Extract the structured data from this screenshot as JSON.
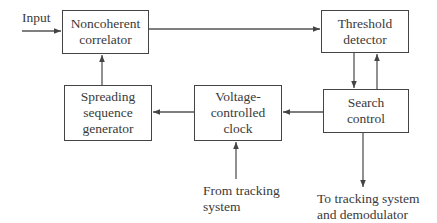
{
  "diagram": {
    "type": "block-diagram",
    "blocks": [
      {
        "id": "noncoherent-correlator",
        "lines": [
          "Noncoherent",
          "correlator"
        ]
      },
      {
        "id": "threshold-detector",
        "lines": [
          "Threshold",
          "detector"
        ]
      },
      {
        "id": "spreading-sequence-generator",
        "lines": [
          "Spreading",
          "sequence",
          "generator"
        ]
      },
      {
        "id": "voltage-controlled-clock",
        "lines": [
          "Voltage-",
          "controlled",
          "clock"
        ]
      },
      {
        "id": "search-control",
        "lines": [
          "Search",
          "control"
        ]
      }
    ],
    "labels": {
      "input": "Input",
      "from_tracking": [
        "From tracking",
        "system"
      ],
      "to_tracking": [
        "To tracking system",
        "and demodulator"
      ]
    },
    "edges": [
      {
        "from": "input",
        "to": "noncoherent-correlator"
      },
      {
        "from": "noncoherent-correlator",
        "to": "threshold-detector"
      },
      {
        "from": "threshold-detector",
        "to": "search-control"
      },
      {
        "from": "search-control",
        "to": "threshold-detector"
      },
      {
        "from": "search-control",
        "to": "voltage-controlled-clock"
      },
      {
        "from": "voltage-controlled-clock",
        "to": "spreading-sequence-generator"
      },
      {
        "from": "spreading-sequence-generator",
        "to": "noncoherent-correlator"
      },
      {
        "from": "from-tracking-system",
        "to": "voltage-controlled-clock"
      },
      {
        "from": "search-control",
        "to": "to-tracking-system-and-demodulator"
      }
    ],
    "colors": {
      "line": "#444444",
      "text": "#3a3a3a",
      "background": "#ffffff"
    }
  }
}
